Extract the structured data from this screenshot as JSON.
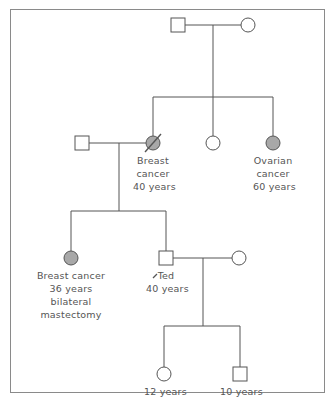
{
  "diagram": {
    "type": "pedigree",
    "colors": {
      "line": "#555555",
      "affected_fill": "#a8a8a8",
      "unaffected_fill": "#ffffff",
      "border": "#8a8a8a"
    },
    "generation1": {
      "father": {
        "sex": "male",
        "affected": false
      },
      "mother": {
        "sex": "female",
        "affected": false
      }
    },
    "generation2": {
      "spouse": {
        "sex": "male",
        "affected": false
      },
      "daughter1": {
        "sex": "female",
        "affected": true,
        "deceased": true,
        "label": [
          "Breast",
          "cancer",
          "40 years"
        ]
      },
      "daughter2": {
        "sex": "female",
        "affected": false
      },
      "daughter3": {
        "sex": "female",
        "affected": true,
        "label": [
          "Ovarian",
          "cancer",
          "60 years"
        ]
      }
    },
    "generation3": {
      "daughter": {
        "sex": "female",
        "affected": true,
        "label": [
          "Breast cancer",
          "36 years",
          "bilateral",
          "mastectomy"
        ]
      },
      "proband": {
        "sex": "male",
        "affected": false,
        "proband": true,
        "label": [
          "Ted",
          "40 years"
        ]
      },
      "spouse": {
        "sex": "female",
        "affected": false
      }
    },
    "generation4": {
      "daughter": {
        "sex": "female",
        "affected": false,
        "label": [
          "12 years"
        ]
      },
      "son": {
        "sex": "male",
        "affected": false,
        "label": [
          "10 years"
        ]
      }
    }
  }
}
